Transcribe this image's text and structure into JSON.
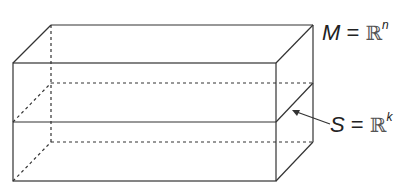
{
  "diagram": {
    "labels": {
      "M": {
        "var": "M",
        "eq": "=",
        "space": "ℝ",
        "exp": "n"
      },
      "S": {
        "var": "S",
        "eq": "=",
        "space": "ℝ",
        "exp": "k"
      }
    },
    "colors": {
      "stroke": "#333333",
      "text": "#222222",
      "background": "#ffffff"
    }
  }
}
